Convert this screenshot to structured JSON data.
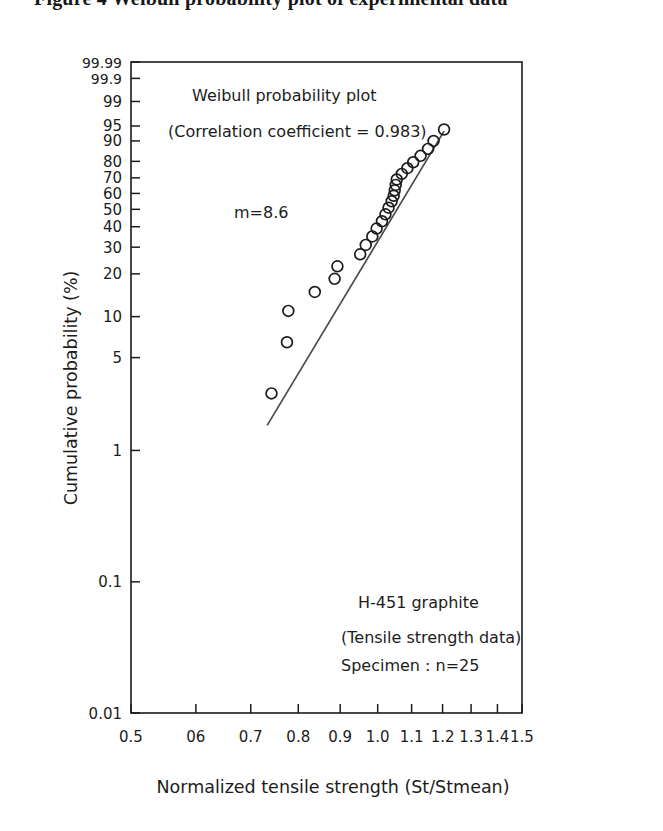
{
  "caption": {
    "text": "Figure 4  Weibull probability plot of experimental data"
  },
  "chart_data": {
    "type": "scatter",
    "title": "Weibull probability plot",
    "xlabel": "Normalized tensile strength  (St/Stmean)",
    "ylabel": "Cumulative probability (%)",
    "x_scale": "log",
    "y_scale": "weibull-probability",
    "xlim": [
      0.5,
      1.5
    ],
    "ylim": [
      0.01,
      99.99
    ],
    "grid": false,
    "legend": "none",
    "x_ticks": [
      "0.5",
      "06",
      "0.7",
      "0.8",
      "0.9",
      "1.0",
      "1.1",
      "1.2",
      "1.3",
      "1.4",
      "1.5"
    ],
    "x_tick_values": [
      0.5,
      0.6,
      0.7,
      0.8,
      0.9,
      1.0,
      1.1,
      1.2,
      1.3,
      1.4,
      1.5
    ],
    "y_ticks": [
      "99.99",
      "99.9",
      "99",
      "95",
      "90",
      "80",
      "70",
      "60",
      "50",
      "40",
      "30",
      "20",
      "10",
      "5",
      "1",
      "0.1",
      "0.01"
    ],
    "y_tick_values": [
      99.99,
      99.9,
      99,
      95,
      90,
      80,
      70,
      60,
      50,
      40,
      30,
      20,
      10,
      5,
      1,
      0.1,
      0.01
    ],
    "annotations": [
      "Weibull probability plot",
      "(Correlation coefficient = 0.983)",
      "m=8.6",
      "H-451 graphite",
      "(Tensile strength data)",
      "Specimen : n=25"
    ],
    "weibull_modulus": 8.6,
    "correlation_coefficient": 0.983,
    "sample_size": 25,
    "material": "H-451 graphite",
    "series": [
      {
        "name": "Tensile strength data",
        "marker": "open-circle",
        "points": [
          {
            "x": 0.742,
            "y": 2.7
          },
          {
            "x": 0.775,
            "y": 6.5
          },
          {
            "x": 0.778,
            "y": 11.0
          },
          {
            "x": 0.838,
            "y": 15.0
          },
          {
            "x": 0.886,
            "y": 18.5
          },
          {
            "x": 0.893,
            "y": 22.5
          },
          {
            "x": 0.952,
            "y": 27.0
          },
          {
            "x": 0.967,
            "y": 31.0
          },
          {
            "x": 0.985,
            "y": 35.0
          },
          {
            "x": 0.997,
            "y": 39.0
          },
          {
            "x": 1.012,
            "y": 43.0
          },
          {
            "x": 1.022,
            "y": 47.0
          },
          {
            "x": 1.031,
            "y": 51.0
          },
          {
            "x": 1.04,
            "y": 55.0
          },
          {
            "x": 1.046,
            "y": 58.5
          },
          {
            "x": 1.049,
            "y": 62.0
          },
          {
            "x": 1.052,
            "y": 65.5
          },
          {
            "x": 1.055,
            "y": 69.0
          },
          {
            "x": 1.07,
            "y": 72.5
          },
          {
            "x": 1.087,
            "y": 76.0
          },
          {
            "x": 1.105,
            "y": 79.5
          },
          {
            "x": 1.128,
            "y": 83.0
          },
          {
            "x": 1.152,
            "y": 86.5
          },
          {
            "x": 1.17,
            "y": 90.0
          },
          {
            "x": 1.205,
            "y": 94.0
          }
        ]
      }
    ],
    "fit_line": {
      "name": "Weibull fit",
      "x_start": 0.733,
      "y_start": 1.55,
      "x_end": 1.205,
      "y_end": 93.5
    }
  }
}
